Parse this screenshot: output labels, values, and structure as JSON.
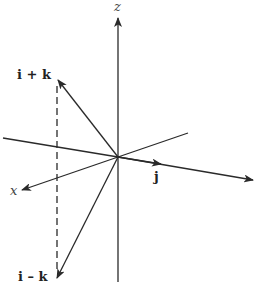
{
  "diagram": {
    "type": "3d-vector-coordinate-system",
    "axes": {
      "x_label": "x",
      "z_label": "z"
    },
    "vectors": {
      "j_label": "j",
      "i_plus_k_label": "i + k",
      "i_minus_k_label": "i – k"
    },
    "colors": {
      "line": "#2a2a2a",
      "background": "#ffffff"
    }
  }
}
